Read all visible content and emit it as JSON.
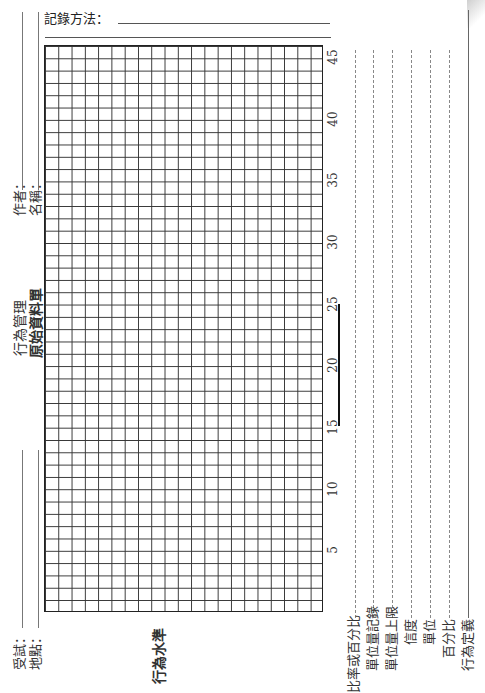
{
  "header": {
    "recording_method_label": "記錄方法："
  },
  "title": {
    "main": "行為管理",
    "sub": "原始資料單"
  },
  "fields": {
    "author_label": "作者：",
    "name_label": "名稱：",
    "subject_label": "受試：",
    "location_label": "地點："
  },
  "axis": {
    "label": "行為水準",
    "ticks": [
      "5",
      "10",
      "15",
      "20",
      "25",
      "30",
      "35",
      "40",
      "45"
    ]
  },
  "grid": {
    "columns": 21,
    "rows": 46
  },
  "summary_columns": [
    {
      "label": "比率或百分比"
    },
    {
      "label": "單位量記錄"
    },
    {
      "label": "單位量上限"
    },
    {
      "label": "信度"
    },
    {
      "label": "單位"
    },
    {
      "label": "百分比"
    },
    {
      "label": "行為定義"
    }
  ]
}
